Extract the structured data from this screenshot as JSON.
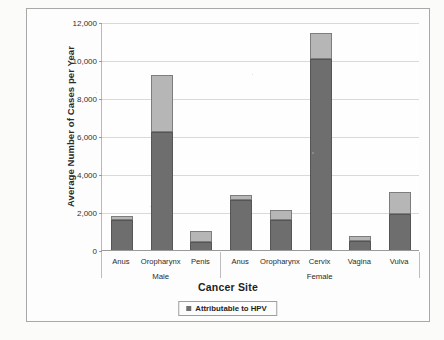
{
  "figure": {
    "border_color": "#a8a8a8",
    "background": "#fdfdfd"
  },
  "legend": {
    "label": "Attributable to HPV",
    "swatch_color": "#6e6e6e",
    "position": "bottom-center"
  },
  "colors": {
    "attributable": "#6e6e6e",
    "other": "#b6b6b6",
    "gridline": "#d9d9d9",
    "axis": "#9a9a9a"
  },
  "chart_data": {
    "type": "bar",
    "title": "",
    "subtitle": "",
    "xlabel": "Cancer Site",
    "ylabel": "Average Number of Cases per Year",
    "ylim": [
      0,
      12000
    ],
    "ytick_labels": [
      "12,000",
      "10,000",
      "8,000",
      "6,000",
      "4,000",
      "2,000",
      "0"
    ],
    "ytick_values": [
      12000,
      10000,
      8000,
      6000,
      4000,
      2000,
      0
    ],
    "grid": true,
    "stacked": true,
    "legend_entries": [
      "Attributable to HPV"
    ],
    "group_labels": [
      "Male",
      "Female"
    ],
    "categories": [
      "Anus",
      "Oropharynx",
      "Penis",
      "Anus",
      "Oropharynx",
      "Cervix",
      "Vagina",
      "Vulva"
    ],
    "groups": [
      {
        "name": "Male",
        "categories": [
          "Anus",
          "Oropharynx",
          "Penis"
        ]
      },
      {
        "name": "Female",
        "categories": [
          "Anus",
          "Oropharynx",
          "Cervix",
          "Vagina",
          "Vulva"
        ]
      }
    ],
    "series": [
      {
        "name": "Attributable to HPV",
        "values": [
          1580,
          6200,
          440,
          2620,
          1580,
          10040,
          490,
          1910
        ]
      },
      {
        "name": "Not attributable to HPV",
        "values": [
          220,
          3000,
          540,
          270,
          550,
          1360,
          270,
          1140
        ]
      }
    ],
    "totals": [
      1800,
      9200,
      980,
      2890,
      2130,
      11400,
      760,
      3050
    ],
    "bars": [
      {
        "group": "Male",
        "category": "Anus",
        "attributable": 1580,
        "other": 220,
        "total": 1800
      },
      {
        "group": "Male",
        "category": "Oropharynx",
        "attributable": 6200,
        "other": 3000,
        "total": 9200
      },
      {
        "group": "Male",
        "category": "Penis",
        "attributable": 440,
        "other": 540,
        "total": 980
      },
      {
        "group": "Female",
        "category": "Anus",
        "attributable": 2620,
        "other": 270,
        "total": 2890
      },
      {
        "group": "Female",
        "category": "Oropharynx",
        "attributable": 1580,
        "other": 550,
        "total": 2130
      },
      {
        "group": "Female",
        "category": "Cervix",
        "attributable": 10040,
        "other": 1360,
        "total": 11400
      },
      {
        "group": "Female",
        "category": "Vagina",
        "attributable": 490,
        "other": 270,
        "total": 760
      },
      {
        "group": "Female",
        "category": "Vulva",
        "attributable": 1910,
        "other": 1140,
        "total": 3050
      }
    ]
  }
}
